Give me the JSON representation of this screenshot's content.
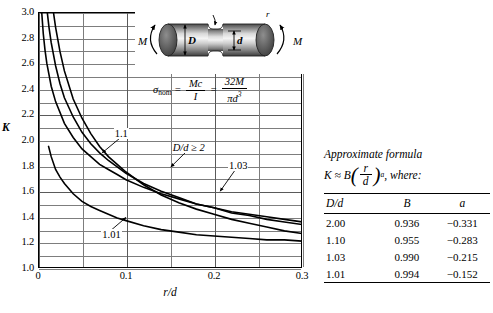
{
  "chart_data": {
    "type": "line",
    "title": "",
    "xlabel": "r/d",
    "ylabel": "K",
    "xlim": [
      0,
      0.3
    ],
    "ylim": [
      1.0,
      3.0
    ],
    "grid": true,
    "x_major_ticks": [
      "0",
      "0.1",
      "0.2",
      "0.3"
    ],
    "x_major_values": [
      0,
      0.1,
      0.2,
      0.3
    ],
    "x_minor_step": 0.05,
    "y_major_ticks": [
      "1.0",
      "1.2",
      "1.4",
      "1.6",
      "1.8",
      "2.0",
      "2.2",
      "2.4",
      "2.6",
      "2.8",
      "3.0"
    ],
    "y_major_values": [
      1.0,
      1.2,
      1.4,
      1.6,
      1.8,
      2.0,
      2.2,
      2.4,
      2.6,
      2.8,
      3.0
    ],
    "y_minor_step": 0.1,
    "legend_position": "inline-callouts",
    "series": [
      {
        "name": "D/d ≥ 2",
        "label": "D/d ≥ 2",
        "B": 0.936,
        "a": -0.331,
        "x": [
          0.0175,
          0.02,
          0.025,
          0.03,
          0.04,
          0.05,
          0.06,
          0.07,
          0.08,
          0.09,
          0.1,
          0.12,
          0.14,
          0.16,
          0.18,
          0.2,
          0.22,
          0.24,
          0.26,
          0.28,
          0.3
        ],
        "values": [
          3.0,
          2.88,
          2.69,
          2.54,
          2.32,
          2.17,
          2.05,
          1.95,
          1.87,
          1.81,
          1.75,
          1.65,
          1.57,
          1.51,
          1.46,
          1.42,
          1.38,
          1.35,
          1.32,
          1.29,
          1.27
        ]
      },
      {
        "name": "1.1",
        "label": "1.1",
        "B": 0.955,
        "a": -0.283,
        "x": [
          0.0105,
          0.0125,
          0.015,
          0.02,
          0.025,
          0.03,
          0.04,
          0.05,
          0.06,
          0.07,
          0.08,
          0.09,
          0.1,
          0.12,
          0.14,
          0.16,
          0.18,
          0.2,
          0.22,
          0.24,
          0.26,
          0.28,
          0.3
        ],
        "values": [
          3.0,
          2.88,
          2.76,
          2.58,
          2.44,
          2.33,
          2.18,
          2.06,
          1.97,
          1.9,
          1.84,
          1.79,
          1.74,
          1.66,
          1.6,
          1.55,
          1.5,
          1.47,
          1.43,
          1.41,
          1.38,
          1.36,
          1.34
        ]
      },
      {
        "name": "1.03",
        "label": "1.03",
        "B": 0.99,
        "a": -0.215,
        "x": [
          0.0042,
          0.006,
          0.008,
          0.01,
          0.015,
          0.02,
          0.03,
          0.04,
          0.05,
          0.06,
          0.07,
          0.08,
          0.09,
          0.1,
          0.12,
          0.14,
          0.16,
          0.18,
          0.2,
          0.22,
          0.24,
          0.26,
          0.28,
          0.3
        ],
        "values": [
          3.0,
          2.83,
          2.7,
          2.6,
          2.42,
          2.3,
          2.13,
          2.02,
          1.93,
          1.87,
          1.81,
          1.77,
          1.73,
          1.69,
          1.63,
          1.58,
          1.54,
          1.5,
          1.47,
          1.44,
          1.42,
          1.4,
          1.38,
          1.36
        ]
      },
      {
        "name": "1.01",
        "label": "1.01",
        "B": 0.994,
        "a": -0.152,
        "x": [
          0.012,
          0.015,
          0.02,
          0.025,
          0.03,
          0.04,
          0.05,
          0.06,
          0.07,
          0.08,
          0.09,
          0.1,
          0.12,
          0.14,
          0.16,
          0.18,
          0.2,
          0.22,
          0.24,
          0.26,
          0.28,
          0.3
        ],
        "values": [
          1.95,
          1.87,
          1.77,
          1.71,
          1.66,
          1.58,
          1.52,
          1.48,
          1.45,
          1.42,
          1.39,
          1.37,
          1.33,
          1.3,
          1.28,
          1.26,
          1.25,
          1.24,
          1.23,
          1.22,
          1.22,
          1.21
        ]
      }
    ],
    "annotations": [
      {
        "text": "1.1",
        "x": 0.086,
        "y": 2.05
      },
      {
        "text": "D/d ≥ 2",
        "x": 0.152,
        "y": 1.94
      },
      {
        "text": "1.03",
        "x": 0.216,
        "y": 1.8
      },
      {
        "text": "1.01",
        "x": 0.072,
        "y": 1.26
      }
    ]
  },
  "inset": {
    "moment_left_label": "M",
    "moment_right_label": "M",
    "diameter_large_label": "D",
    "diameter_small_label": "d",
    "radius_label": "r",
    "formula": {
      "lhs": "σ",
      "lhs_sub": "nom",
      "eq1": "=",
      "f1_num": "Mc",
      "f1_den": "I",
      "eq2": "=",
      "f2_num": "32M",
      "f2_den_base": "πd",
      "f2_den_exp": "3"
    }
  },
  "side": {
    "approx_title": "Approximate formula",
    "formula": {
      "k": "K",
      "approx": "≈",
      "b": "B",
      "open_paren": "(",
      "num": "r",
      "den": "d",
      "close_paren": ")",
      "exponent": "a",
      "tail": ", where:"
    },
    "table": {
      "headers": [
        "D/d",
        "B",
        "a"
      ],
      "rows": [
        [
          "2.00",
          "0.936",
          "−0.331"
        ],
        [
          "1.10",
          "0.955",
          "−0.283"
        ],
        [
          "1.03",
          "0.990",
          "−0.215"
        ],
        [
          "1.01",
          "0.994",
          "−0.152"
        ]
      ]
    }
  }
}
